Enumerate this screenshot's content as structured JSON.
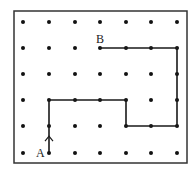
{
  "diagram": {
    "type": "dot-grid-path",
    "grid": {
      "columns": 7,
      "rows": 6,
      "x_positions": [
        23,
        49,
        75,
        100,
        126,
        151,
        177
      ],
      "y_positions": [
        22,
        48,
        74,
        100,
        126,
        153
      ]
    },
    "frame": {
      "x": 14,
      "y": 11,
      "width": 173,
      "height": 152
    },
    "path": {
      "description": "Path from A to B along grid points",
      "points_col_row": [
        [
          1,
          5
        ],
        [
          1,
          3
        ],
        [
          2,
          3
        ],
        [
          3,
          3
        ],
        [
          4,
          3
        ],
        [
          4,
          4
        ],
        [
          5,
          4
        ],
        [
          6,
          4
        ],
        [
          6,
          3
        ],
        [
          6,
          2
        ],
        [
          6,
          1
        ],
        [
          5,
          1
        ],
        [
          4,
          1
        ],
        [
          3,
          1
        ]
      ],
      "color": "#1a1a1a"
    },
    "labels": {
      "start": "A",
      "end": "B"
    },
    "arrow": {
      "at_col_row": [
        1,
        4.6
      ],
      "direction": "up"
    }
  }
}
